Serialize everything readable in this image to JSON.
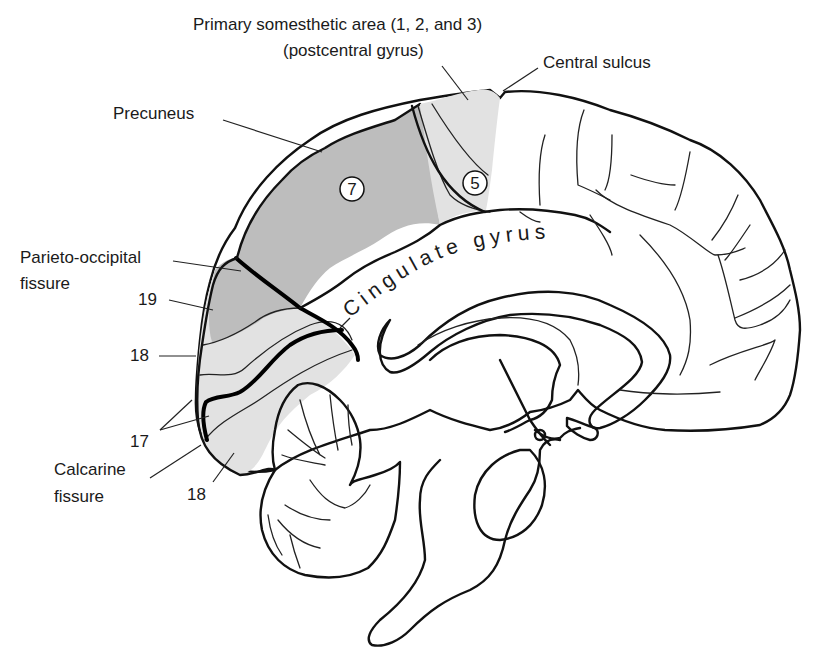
{
  "figure": {
    "labels": {
      "primary_somesthetic_line1": "Primary somesthetic area (1, 2, and 3)",
      "primary_somesthetic_line2": "(postcentral gyrus)",
      "central_sulcus": "Central sulcus",
      "precuneus": "Precuneus",
      "parieto_occipital_line1": "Parieto-occipital",
      "parieto_occipital_line2": "fissure",
      "area_19": "19",
      "area_18_upper": "18",
      "area_17": "17",
      "calcarine_line1": "Calcarine",
      "calcarine_line2": "fissure",
      "area_18_lower": "18",
      "cingulate_gyrus": "Cingulate gyrus",
      "area_7_circle": "7",
      "area_5_circle": "5"
    },
    "shading": {
      "dark_gray": "#bdbdbd",
      "light_gray": "#e2e2e2",
      "outline": "#111111"
    }
  }
}
